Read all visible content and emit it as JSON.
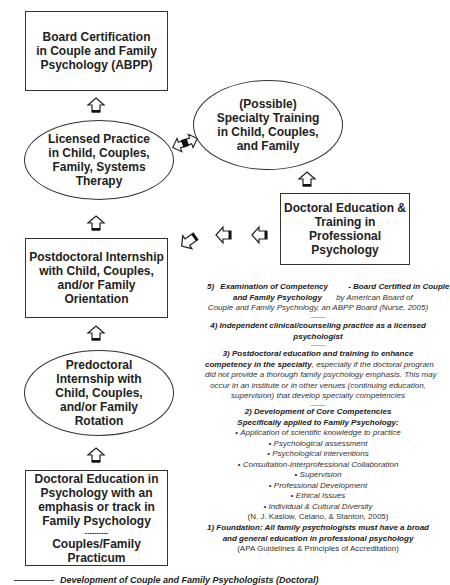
{
  "diagram": {
    "nodes": {
      "board_certification": {
        "lines": [
          "Board Certification",
          "in Couple and Family",
          "Psychology (ABPP)"
        ]
      },
      "licensed_practice": {
        "lines": [
          "Licensed Practice",
          "in Child, Couples,",
          "Family, Systems",
          "Therapy"
        ]
      },
      "specialty_training": {
        "lines": [
          "(Possible)",
          "Specialty Training",
          "in Child, Couples,",
          "and Family"
        ]
      },
      "doctoral_education_training": {
        "lines": [
          "Doctoral Education &",
          "Training in",
          "Professional",
          "Psychology"
        ]
      },
      "postdoctoral_internship": {
        "lines": [
          "Postdoctoral Internship",
          "with Child, Couples,",
          "and/or Family",
          "Orientation"
        ]
      },
      "predoctoral_internship": {
        "lines": [
          "Predoctoral",
          "Internship with",
          "Child, Couples,",
          "and/or Family",
          "Rotation"
        ]
      },
      "doctoral_education_psych": {
        "lines": [
          "Doctoral Education in",
          "Psychology with an",
          "emphasis or track in",
          "Family Psychology"
        ],
        "separator": "----------",
        "sub_lines": [
          "Couples/Family",
          "Practicum"
        ]
      }
    },
    "notes": {
      "step5": {
        "number": "5)",
        "title_a": "Examination of Competency",
        "title_b": "and Family Psychology",
        "right_a": "- Board Certified in Couple",
        "right_b": "by American Board of",
        "line3": "Couple and Family Psychology, an ABPP Board (Nurse, 2005)"
      },
      "step4": {
        "text_a": "4)  Independent clinical/counseling practice as a licensed",
        "text_b": "psychologist"
      },
      "step3": {
        "title_a": "3)  Postdoctoral education and training to enhance",
        "title_b": "competency in the specialty",
        "rest_a": ", especially if the doctoral program",
        "line3": "did not provide a thorough family psychology emphasis. This may",
        "line4": "occur in an institute or in other venues (continuing education,",
        "line5": "supervision) that develop specialty competencies"
      },
      "step2": {
        "title_a": "2)  Development of Core Competencies",
        "title_b": "Specifically applied to Family Psychology:",
        "bullets": [
          "Application of scientific knowledge to practice",
          "Psychological assessment",
          "Psychological interventions",
          "Consultation-Interprofessional Collaboration",
          "Supervision",
          "Professional Development",
          "Ethical Issues",
          "Individual & Cultural Diversity"
        ],
        "citation": "(N. J. Kaslow, Celano, & Stanton, 2005)"
      },
      "step1": {
        "title_a": "1) Foundation: All family psychologists must have a broad",
        "title_b": "and general education in professional psychology",
        "citation": "(APA Guidelines & Principles of Accreditation)"
      },
      "separator": "----------"
    },
    "caption": "Development of Couple and Family Psychologists (Doctoral)"
  }
}
